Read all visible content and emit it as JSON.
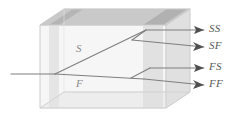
{
  "figure": {
    "name": "wave-splitting-in-anisotropic-medium-diagram",
    "background_color": "#ffffff",
    "box": {
      "body_fill": "#f4f4f4",
      "top_face_fill": "#c8c8c8",
      "right_face_fill": "#dcdcdc",
      "bottom_face_fill": "#eeeeee",
      "slab_fill": "#d8d8d8",
      "edge_color": "#d0d0d0"
    },
    "ray_color": "#7b7b7b",
    "arrow_color": "#4f4f4f"
  },
  "labels": {
    "interior": [
      {
        "id": "slow-path",
        "text": "S",
        "x": 78,
        "y": 48
      },
      {
        "id": "fast-path",
        "text": "F",
        "x": 78,
        "y": 83
      }
    ],
    "outputs": [
      {
        "id": "slow-slow",
        "text": "SS",
        "x": 211,
        "y": 27
      },
      {
        "id": "slow-fast",
        "text": "SF",
        "x": 211,
        "y": 44
      },
      {
        "id": "fast-slow",
        "text": "FS",
        "x": 211,
        "y": 67
      },
      {
        "id": "fast-fast",
        "text": "FF",
        "x": 211,
        "y": 84
      }
    ]
  },
  "rays": {
    "incident": {
      "id": "incident-ray",
      "from_x": 10,
      "from_y": 74,
      "to_x": 55,
      "to_y": 74
    },
    "split_point_1": {
      "x": 55,
      "y": 74
    },
    "slow_branch": {
      "to_x": 145,
      "to_y": 30
    },
    "fast_branch": {
      "to_x": 143,
      "to_y": 79
    },
    "outputs": [
      {
        "id": "ray-ss",
        "x1": 145,
        "y1": 30,
        "x2": 206,
        "y2": 30
      },
      {
        "id": "ray-sf",
        "x1": 145,
        "y1": 30,
        "x2": 206,
        "y2": 47
      },
      {
        "id": "ray-fs",
        "x1": 143,
        "y1": 69,
        "x2": 206,
        "y2": 69
      },
      {
        "id": "ray-ff",
        "x1": 143,
        "y1": 79,
        "x2": 206,
        "y2": 86
      }
    ]
  }
}
